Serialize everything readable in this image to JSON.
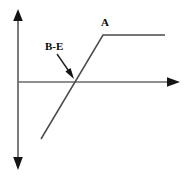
{
  "figure": {
    "type": "line-diagram",
    "background_color": "#ffffff",
    "stroke_color": "#3a3a3a",
    "label_color": "#0a0a0a",
    "labels": {
      "plateau_label": "A",
      "breakpoint_label": "B-E"
    },
    "axes": {
      "y_axis": {
        "name": "vertical-axis",
        "x": 18,
        "y_top": 11,
        "y_bottom": 167,
        "arrow_top": true,
        "arrow_bottom": true
      },
      "x_axis": {
        "name": "horizontal-axis",
        "y": 82,
        "x_left": 18,
        "x_right": 176,
        "arrow_right": true,
        "arrow_left": false
      },
      "origin": {
        "x": 18,
        "y": 82
      }
    },
    "curve": {
      "name": "piecewise-response-curve",
      "points": [
        {
          "x": 41,
          "y": 139
        },
        {
          "x": 103,
          "y": 35
        },
        {
          "x": 165,
          "y": 35
        }
      ],
      "axis_crossing": {
        "x": 73,
        "y": 82
      }
    },
    "annotation_arrow": {
      "name": "b-e-pointer",
      "from": {
        "x": 58,
        "y": 55
      },
      "to": {
        "x": 73,
        "y": 77
      },
      "head_filled": true
    }
  }
}
